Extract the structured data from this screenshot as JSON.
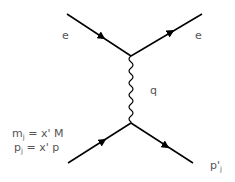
{
  "diagram": {
    "type": "feynman",
    "labels": {
      "incoming_top": "e",
      "outgoing_top": "e",
      "propagator": "q",
      "mass_relation_lhs": "m",
      "mass_relation_sub": "j",
      "mass_relation_rhs": " = x' M",
      "momentum_relation_lhs": "p",
      "momentum_relation_sub": "j",
      "momentum_relation_rhs": " = x' p",
      "outgoing_bottom": "p'",
      "outgoing_bottom_sub": "j"
    },
    "colors": {
      "line": "#000000",
      "text": "#555555"
    }
  }
}
